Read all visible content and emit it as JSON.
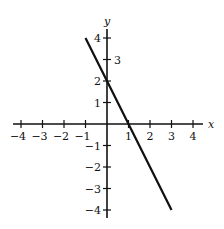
{
  "chart_data": {
    "type": "line",
    "title": "",
    "xlabel": "x",
    "ylabel": "y",
    "xlim": [
      -4,
      4
    ],
    "ylim": [
      -4,
      4
    ],
    "grid": false,
    "x_ticks": [
      -4,
      -3,
      -2,
      -1,
      1,
      2,
      3,
      4
    ],
    "x_tick_labels": [
      "−4",
      "−3",
      "−2",
      "−1",
      "1",
      "2",
      "3",
      "4"
    ],
    "y_ticks": [
      4,
      3,
      2,
      1,
      -1,
      -2,
      -3,
      -4
    ],
    "y_tick_labels": [
      "4",
      "3",
      "2",
      "1",
      "−1",
      "−2",
      "−3",
      "−4"
    ],
    "series": [
      {
        "name": "y = -2x + 2",
        "x": [
          -1,
          3
        ],
        "y": [
          4,
          -4
        ],
        "color": "#111111"
      }
    ]
  },
  "layout": {
    "origin_px": [
      107,
      124
    ],
    "unit_px": 21.5
  }
}
